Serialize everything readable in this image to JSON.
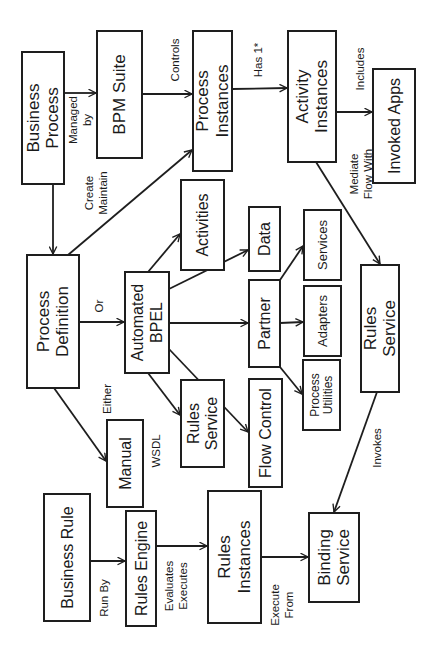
{
  "diagram": {
    "orientation": "rotated 90 degrees counter-clockwise",
    "colors": {
      "stroke": "#1e1e1e",
      "text": "#1a1a1a",
      "background": "#ffffff"
    },
    "nodes": [
      {
        "id": "business-process",
        "lines": [
          "Business",
          "Process"
        ],
        "x": 22,
        "y": 52,
        "w": 42,
        "h": 132,
        "fs": 17
      },
      {
        "id": "bpm-suite",
        "lines": [
          "BPM Suite"
        ],
        "x": 97,
        "y": 31,
        "w": 45,
        "h": 127,
        "fs": 17
      },
      {
        "id": "process-instances",
        "lines": [
          "Process",
          "Instances"
        ],
        "x": 193,
        "y": 31,
        "w": 39,
        "h": 140,
        "fs": 17
      },
      {
        "id": "activity-instances",
        "lines": [
          "Activity",
          "Instances"
        ],
        "x": 288,
        "y": 31,
        "w": 48,
        "h": 131,
        "fs": 17
      },
      {
        "id": "invoked-apps",
        "lines": [
          "Invoked Apps"
        ],
        "x": 373,
        "y": 69,
        "w": 42,
        "h": 114,
        "fs": 16
      },
      {
        "id": "process-definition",
        "lines": [
          "Process",
          "Definition"
        ],
        "x": 27,
        "y": 255,
        "w": 52,
        "h": 133,
        "fs": 17
      },
      {
        "id": "automated-bpel",
        "lines": [
          "Automated",
          "BPEL"
        ],
        "x": 125,
        "y": 272,
        "w": 44,
        "h": 101,
        "fs": 16
      },
      {
        "id": "activities",
        "lines": [
          "Activities"
        ],
        "x": 181,
        "y": 180,
        "w": 43,
        "h": 90,
        "fs": 16
      },
      {
        "id": "data",
        "lines": [
          "Data"
        ],
        "x": 249,
        "y": 207,
        "w": 31,
        "h": 64,
        "fs": 16
      },
      {
        "id": "partner",
        "lines": [
          "Partner"
        ],
        "x": 249,
        "y": 280,
        "w": 31,
        "h": 87,
        "fs": 16
      },
      {
        "id": "services",
        "lines": [
          "Services"
        ],
        "x": 304,
        "y": 210,
        "w": 37,
        "h": 70,
        "fs": 13
      },
      {
        "id": "adapters",
        "lines": [
          "Adapters"
        ],
        "x": 304,
        "y": 286,
        "w": 37,
        "h": 70,
        "fs": 13
      },
      {
        "id": "process-utilities",
        "lines": [
          "Process",
          "Utilities"
        ],
        "x": 303,
        "y": 360,
        "w": 37,
        "h": 70,
        "fs": 12
      },
      {
        "id": "rules-service-right",
        "lines": [
          "Rules",
          "Service"
        ],
        "x": 361,
        "y": 265,
        "w": 38,
        "h": 127,
        "fs": 17
      },
      {
        "id": "rules-service-mid",
        "lines": [
          "Rules",
          "Service"
        ],
        "x": 181,
        "y": 380,
        "w": 43,
        "h": 87,
        "fs": 16
      },
      {
        "id": "flow-control",
        "lines": [
          "Flow Control"
        ],
        "x": 249,
        "y": 379,
        "w": 33,
        "h": 108,
        "fs": 16
      },
      {
        "id": "manual",
        "lines": [
          "Manual"
        ],
        "x": 107,
        "y": 420,
        "w": 36,
        "h": 87,
        "fs": 16
      },
      {
        "id": "business-rule",
        "lines": [
          "Business Rule"
        ],
        "x": 44,
        "y": 494,
        "w": 46,
        "h": 127,
        "fs": 16
      },
      {
        "id": "rules-engine",
        "lines": [
          "Rules Engine"
        ],
        "x": 126,
        "y": 511,
        "w": 30,
        "h": 115,
        "fs": 16
      },
      {
        "id": "rules-instances",
        "lines": [
          "Rules",
          "Instances"
        ],
        "x": 208,
        "y": 491,
        "w": 53,
        "h": 132,
        "fs": 17
      },
      {
        "id": "binding-service",
        "lines": [
          "Binding",
          "Service"
        ],
        "x": 309,
        "y": 513,
        "w": 50,
        "h": 89,
        "fs": 17
      }
    ],
    "edges": [
      {
        "id": "bp-to-bpm",
        "from": "business-process",
        "to": "bpm-suite",
        "x1": 64,
        "y1": 93,
        "x2": 96,
        "y2": 93,
        "arrow": true
      },
      {
        "id": "bpm-to-pi",
        "from": "bpm-suite",
        "to": "process-instances",
        "x1": 142,
        "y1": 94,
        "x2": 192,
        "y2": 94,
        "arrow": true
      },
      {
        "id": "pi-to-ai",
        "from": "process-instances",
        "to": "activity-instances",
        "x1": 232,
        "y1": 89,
        "x2": 287,
        "y2": 88,
        "arrow": true
      },
      {
        "id": "ai-to-apps",
        "from": "activity-instances",
        "to": "invoked-apps",
        "x1": 336,
        "y1": 112,
        "x2": 372,
        "y2": 112,
        "arrow": true
      },
      {
        "id": "bp-to-pd",
        "from": "business-process",
        "to": "process-definition",
        "x1": 53,
        "y1": 184,
        "x2": 53,
        "y2": 254,
        "arrow": true
      },
      {
        "id": "pd-to-pi",
        "from": "process-definition",
        "to": "process-instances",
        "x1": 68,
        "y1": 255,
        "x2": 192,
        "y2": 150,
        "arrow": true
      },
      {
        "id": "pd-to-bpel",
        "from": "process-definition",
        "to": "automated-bpel",
        "x1": 79,
        "y1": 322,
        "x2": 124,
        "y2": 322,
        "arrow": true
      },
      {
        "id": "pd-to-manual",
        "from": "process-definition",
        "to": "manual",
        "x1": 54,
        "y1": 388,
        "x2": 106,
        "y2": 461,
        "arrow": true
      },
      {
        "id": "bpel-to-activities",
        "from": "automated-bpel",
        "to": "activities",
        "x1": 148,
        "y1": 272,
        "x2": 180,
        "y2": 234,
        "arrow": true
      },
      {
        "id": "bpel-to-data",
        "from": "automated-bpel",
        "to": "data",
        "x1": 169,
        "y1": 289,
        "x2": 248,
        "y2": 250,
        "arrow": true
      },
      {
        "id": "bpel-to-partner",
        "from": "automated-bpel",
        "to": "partner",
        "x1": 169,
        "y1": 323,
        "x2": 248,
        "y2": 323,
        "arrow": true
      },
      {
        "id": "bpel-to-flow",
        "from": "automated-bpel",
        "to": "flow-control",
        "x1": 169,
        "y1": 349,
        "x2": 248,
        "y2": 432,
        "arrow": true
      },
      {
        "id": "bpel-to-rules",
        "from": "automated-bpel",
        "to": "rules-service-mid",
        "x1": 148,
        "y1": 373,
        "x2": 180,
        "y2": 415,
        "arrow": true
      },
      {
        "id": "partner-to-services",
        "from": "partner",
        "to": "services",
        "x1": 280,
        "y1": 280,
        "x2": 303,
        "y2": 246,
        "arrow": true
      },
      {
        "id": "partner-to-adapters",
        "from": "partner",
        "to": "adapters",
        "x1": 280,
        "y1": 323,
        "x2": 303,
        "y2": 322,
        "arrow": true
      },
      {
        "id": "partner-to-utilities",
        "from": "partner",
        "to": "process-utilities",
        "x1": 280,
        "y1": 367,
        "x2": 302,
        "y2": 394,
        "arrow": true
      },
      {
        "id": "ai-to-rules",
        "from": "activity-instances",
        "to": "rules-service-right",
        "x1": 316,
        "y1": 162,
        "x2": 380,
        "y2": 264,
        "arrow": true
      },
      {
        "id": "rules-to-binding",
        "from": "rules-service-right",
        "to": "binding-service",
        "x1": 377,
        "y1": 392,
        "x2": 334,
        "y2": 512,
        "arrow": true
      },
      {
        "id": "br-to-engine",
        "from": "business-rule",
        "to": "rules-engine",
        "x1": 90,
        "y1": 561,
        "x2": 125,
        "y2": 561,
        "arrow": true
      },
      {
        "id": "engine-to-ri",
        "from": "rules-engine",
        "to": "rules-instances",
        "x1": 156,
        "y1": 546,
        "x2": 207,
        "y2": 546,
        "arrow": true
      },
      {
        "id": "ri-to-binding",
        "from": "rules-instances",
        "to": "binding-service",
        "x1": 261,
        "y1": 557,
        "x2": 308,
        "y2": 557,
        "arrow": true
      }
    ],
    "edge_labels": [
      {
        "id": "label-managed-by",
        "lines": [
          "Managed",
          "by"
        ],
        "cx": 80,
        "cy": 120
      },
      {
        "id": "label-controls",
        "lines": [
          "Controls"
        ],
        "cx": 175,
        "cy": 60
      },
      {
        "id": "label-has",
        "lines": [
          "Has 1*"
        ],
        "cx": 258,
        "cy": 60
      },
      {
        "id": "label-includes",
        "lines": [
          "Includes"
        ],
        "cx": 360,
        "cy": 69
      },
      {
        "id": "label-create-maintain",
        "lines": [
          "Create",
          "Maintain"
        ],
        "cx": 96,
        "cy": 193
      },
      {
        "id": "label-mediate-flow",
        "lines": [
          "Mediate",
          "Flow With"
        ],
        "cx": 361,
        "cy": 174
      },
      {
        "id": "label-or",
        "lines": [
          "Or"
        ],
        "cx": 99,
        "cy": 306
      },
      {
        "id": "label-either",
        "lines": [
          "Either"
        ],
        "cx": 107,
        "cy": 399
      },
      {
        "id": "label-wsdl",
        "lines": [
          "WSDL"
        ],
        "cx": 156,
        "cy": 451
      },
      {
        "id": "label-invokes",
        "lines": [
          "Invokes"
        ],
        "cx": 377,
        "cy": 448
      },
      {
        "id": "label-run-by",
        "lines": [
          "Run By"
        ],
        "cx": 104,
        "cy": 598
      },
      {
        "id": "label-evaluates-executes",
        "lines": [
          "Evaluates",
          "Executes"
        ],
        "cx": 176,
        "cy": 586
      },
      {
        "id": "label-execute-from",
        "lines": [
          "Execute",
          "From"
        ],
        "cx": 282,
        "cy": 605
      }
    ]
  }
}
